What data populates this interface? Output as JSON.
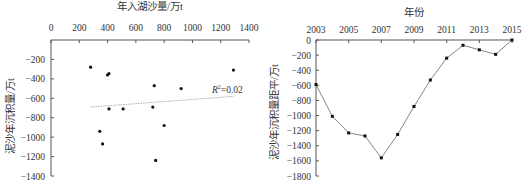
{
  "chart_data": [
    {
      "type": "scatter",
      "title": "",
      "xlabel": "年入湖沙量/万t",
      "ylabel": "泥沙年沉积量/万t",
      "x_ticks": [
        "0",
        "200",
        "400",
        "600",
        "800",
        "1000",
        "1200",
        "1400"
      ],
      "y_ticks": [
        "-200",
        "-400",
        "-600",
        "-800",
        "-1000",
        "-1200",
        "-1400"
      ],
      "xlim": [
        0,
        1400
      ],
      "ylim": [
        -1400,
        0
      ],
      "x_axis_position": "top",
      "grid": false,
      "series": [
        {
          "name": "points",
          "points": [
            {
              "x": 280,
              "y": -280
            },
            {
              "x": 400,
              "y": -360
            },
            {
              "x": 410,
              "y": -345
            },
            {
              "x": 730,
              "y": -470
            },
            {
              "x": 920,
              "y": -500
            },
            {
              "x": 1290,
              "y": -310
            },
            {
              "x": 410,
              "y": -710
            },
            {
              "x": 510,
              "y": -710
            },
            {
              "x": 720,
              "y": -690
            },
            {
              "x": 800,
              "y": -880
            },
            {
              "x": 345,
              "y": -940
            },
            {
              "x": 365,
              "y": -1070
            },
            {
              "x": 740,
              "y": -1240
            }
          ]
        }
      ],
      "trendline": {
        "x": [
          280,
          1290
        ],
        "y": [
          -690,
          -580
        ],
        "label": "R²=0.02",
        "r2_text": "=0.02",
        "r_label": "R",
        "sup": "2"
      }
    },
    {
      "type": "line",
      "title": "",
      "xlabel": "年份",
      "ylabel": "泥沙年沉积量距平/万t",
      "x_ticks": [
        "2003",
        "2005",
        "2007",
        "2009",
        "2011",
        "2013",
        "2015"
      ],
      "y_ticks": [
        "0",
        "-200",
        "-400",
        "-600",
        "-800",
        "-1000",
        "-1200",
        "-1400",
        "-1600",
        "-1800"
      ],
      "xlim": [
        2003,
        2015
      ],
      "ylim": [
        -1800,
        0
      ],
      "x_axis_position": "top",
      "grid": false,
      "x": [
        2003,
        2004,
        2005,
        2006,
        2007,
        2008,
        2009,
        2010,
        2011,
        2012,
        2013,
        2014,
        2015
      ],
      "series": [
        {
          "name": "anomaly",
          "values": [
            -590,
            -1010,
            -1230,
            -1270,
            -1560,
            -1250,
            -880,
            -530,
            -240,
            -70,
            -130,
            -190,
            0
          ]
        }
      ]
    }
  ]
}
